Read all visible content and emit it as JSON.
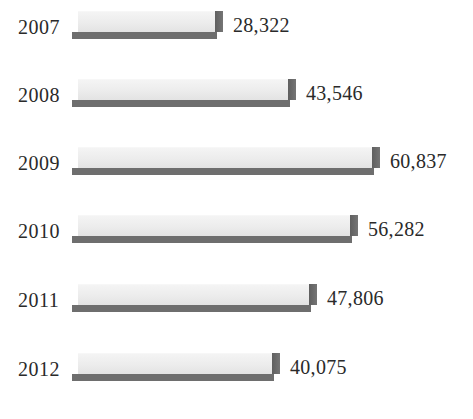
{
  "chart_data": {
    "type": "bar",
    "orientation": "horizontal",
    "title": "",
    "subtitle": "",
    "xlabel": "",
    "ylabel": "",
    "grid": false,
    "legend": null,
    "axis_visible": false,
    "value_label_format": "comma-separated integer",
    "categories": [
      "2007",
      "2008",
      "2009",
      "2010",
      "2011",
      "2012"
    ],
    "values": [
      28322,
      43546,
      60837,
      56282,
      47806,
      40075
    ],
    "value_labels": [
      "28,322",
      "43,546",
      "60,837",
      "56,282",
      "47,806",
      "40,075"
    ],
    "xlim": [
      0,
      60837
    ],
    "series": [
      {
        "name": "",
        "values": [
          28322,
          43546,
          60837,
          56282,
          47806,
          40075
        ]
      }
    ],
    "style": {
      "bar_face_color": "#ececec",
      "bar_shadow_color": "#6e6e6e",
      "text_color": "#2a2a2a",
      "background_color": "#ffffff",
      "three_d": true
    }
  },
  "rows": [
    {
      "year": "2007",
      "value_label": "28,322",
      "value": 28322
    },
    {
      "year": "2008",
      "value_label": "43,546",
      "value": 43546
    },
    {
      "year": "2009",
      "value_label": "60,837",
      "value": 60837
    },
    {
      "year": "2010",
      "value_label": "56,282",
      "value": 56282
    },
    {
      "year": "2011",
      "value_label": "47,806",
      "value": 47806
    },
    {
      "year": "2012",
      "value_label": "40,075",
      "value": 40075
    }
  ]
}
